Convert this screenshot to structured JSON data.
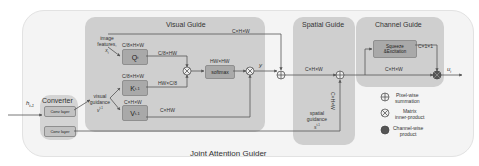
{
  "diagram": {
    "title": "Joint Attention Guider",
    "input_label": "h",
    "input_subscript": "t-1",
    "converter": {
      "title": "Converter",
      "layers": [
        "Conv layer",
        "Conv layer"
      ]
    },
    "visual_guide": {
      "title": "Visual Guide",
      "image_features_label": "image features,",
      "image_features_symbol": "x",
      "image_features_subscript": "t",
      "visual_guidance_label": "visual guidance",
      "visual_guidance_symbol": "v",
      "visual_guidance_superscript": "t-1",
      "q_box": "Q",
      "q_sub": "t",
      "k_box": "K",
      "k_sub": "t-1",
      "v_box": "V",
      "v_sub": "t-1",
      "q_dim": "C/8×H×W",
      "k_dim": "C/8×H×W",
      "v_dim": "C×H×W",
      "q_reshape": "C/8×HW",
      "k_reshape": "HW×C/8",
      "v_reshape": "C×HW",
      "softmax_label": "softmax",
      "softmax_dim": "HW×HW",
      "skip_dim": "C×H×W",
      "output_symbol": "y"
    },
    "spatial_guide": {
      "title": "Spatial Guide",
      "dim": "C×H×W",
      "vertical_dim": "C×H×W",
      "spatial_guidance_label": "spatial guidance",
      "spatial_guidance_symbol": "s",
      "spatial_guidance_superscript": "t-1"
    },
    "channel_guide": {
      "title": "Channel Guide",
      "se_label_1": "Squeeze",
      "se_label_2": "&Excitation",
      "se_dim": "C×1×1",
      "dim": "C×H×W",
      "output_symbol": "u",
      "output_subscript": "t"
    },
    "legend": [
      {
        "icon": "pixel-wise-summation-icon",
        "label_1": "Pixel-wise",
        "label_2": "summation"
      },
      {
        "icon": "matrix-inner-product-icon",
        "label_1": "Matrix",
        "label_2": "inner-product"
      },
      {
        "icon": "channel-wise-product-icon",
        "label_1": "Channel-wise",
        "label_2": "product"
      }
    ],
    "colors": {
      "panel": "#cfcfcf",
      "box": "#a9a9a9",
      "outer": "#f4f4f4",
      "line": "#555555"
    }
  }
}
